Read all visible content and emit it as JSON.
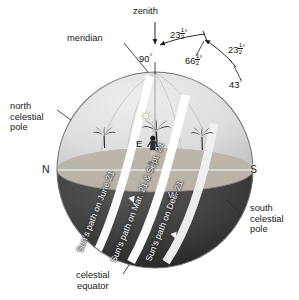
{
  "diagram": {
    "zenith_label": "zenith",
    "meridian_label": "meridian",
    "north_pole_label": "north\ncelestial\npole",
    "south_pole_label": "south\ncelestial\npole",
    "equator_label": "celestial\nequator"
  },
  "cardinals": [
    {
      "id": "north",
      "label": "N"
    },
    {
      "id": "south",
      "label": "S"
    },
    {
      "id": "east",
      "label": "E"
    },
    {
      "id": "west",
      "label": "W"
    }
  ],
  "angles": [
    {
      "id": "zenith-altitude",
      "value": "90",
      "unit": "deg",
      "fraction": "",
      "text": "90°"
    },
    {
      "id": "zenith-to-summer-solstice",
      "value": "23",
      "unit": "deg",
      "fraction": "1/2",
      "text": "23 1/2 °"
    },
    {
      "id": "equator-altitude",
      "value": "66",
      "unit": "deg",
      "fraction": "1/2",
      "text": "66 1/2 °"
    },
    {
      "id": "equator-to-winter-solstice",
      "value": "23",
      "unit": "deg",
      "fraction": "1/2",
      "text": "23 1/2 °"
    },
    {
      "id": "winter-solstice-altitude",
      "value": "43",
      "unit": "deg",
      "fraction": "",
      "text": "43°"
    }
  ],
  "sun_paths": [
    {
      "id": "june",
      "label": "Sun's path on June 21"
    },
    {
      "id": "equinox",
      "label": "Sun's path on Mar. 21 & Sept. 21"
    },
    {
      "id": "december",
      "label": "Sun's path on Dec. 21"
    }
  ],
  "scene": {
    "observer": "observer-figure",
    "trees": [
      "palm-tree-left",
      "palm-tree-center",
      "palm-tree-right"
    ],
    "sun": "sun-glyph"
  },
  "colors": {
    "upper_hemisphere": "#d9d9d9",
    "lower_hemisphere": "#3b3b3b",
    "horizon_plane": "#9a9a9a",
    "horizon_band": "#c9c9c9",
    "sun_path_band": "#ffffff",
    "outline": "#6e6e6e",
    "text": "#181818"
  }
}
